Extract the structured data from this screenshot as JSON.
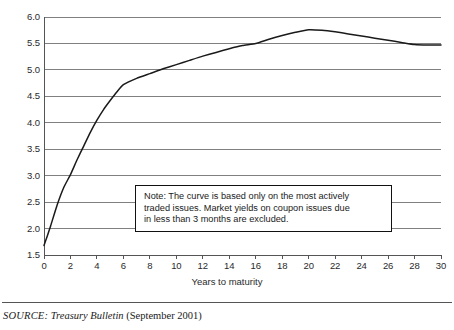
{
  "chart_data": {
    "type": "line",
    "title": "",
    "xlabel": "Years to maturity",
    "ylabel": "",
    "xlim": [
      0,
      30
    ],
    "ylim": [
      1.5,
      6.0
    ],
    "grid": true,
    "legend": "none",
    "x_ticks": [
      "0",
      "2",
      "4",
      "6",
      "8",
      "10",
      "12",
      "14",
      "16",
      "18",
      "20",
      "22",
      "24",
      "26",
      "28",
      "30"
    ],
    "y_ticks": [
      "1.5",
      "2.0",
      "2.5",
      "3.0",
      "3.5",
      "4.0",
      "4.5",
      "5.0",
      "5.5",
      "6.0"
    ],
    "series": [
      {
        "name": "Treasury yield curve",
        "x": [
          0,
          0.25,
          0.5,
          1,
          1.5,
          2,
          2.5,
          3,
          3.5,
          4,
          4.5,
          5,
          5.5,
          6,
          7,
          8,
          9,
          10,
          11,
          12,
          13,
          14,
          15,
          16,
          17,
          18,
          19,
          20,
          21,
          22,
          23,
          24,
          25,
          26,
          27,
          28,
          29,
          30
        ],
        "values": [
          1.68,
          1.86,
          2.05,
          2.45,
          2.78,
          3.02,
          3.3,
          3.56,
          3.82,
          4.05,
          4.25,
          4.42,
          4.58,
          4.72,
          4.84,
          4.93,
          5.02,
          5.1,
          5.18,
          5.26,
          5.33,
          5.4,
          5.46,
          5.5,
          5.58,
          5.65,
          5.71,
          5.76,
          5.75,
          5.72,
          5.68,
          5.64,
          5.6,
          5.56,
          5.52,
          5.48,
          5.47,
          5.47
        ]
      }
    ],
    "annotations": [
      {
        "name": "note-box",
        "lines": [
          "Note: The curve is based only on the most actively",
          "traded issues. Market yields on coupon issues due",
          "in less than 3 months are excluded."
        ]
      }
    ]
  },
  "colors": {
    "curve": "#1a1a1a",
    "gridline": "#808080",
    "axis": "#555555",
    "note_border": "#111111",
    "background": "#ffffff"
  },
  "footer": {
    "source_label": "SOURCE:",
    "publication": "Treasury Bulletin",
    "date": "(September 2001)"
  }
}
